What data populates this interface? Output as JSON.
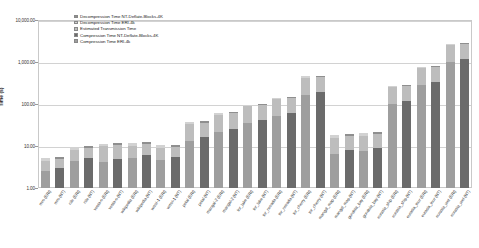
{
  "chart_data": {
    "type": "bar",
    "stacked": true,
    "title": "",
    "xlabel": "",
    "ylabel": "Time (s)",
    "yscale": "log",
    "ylim": [
      1,
      10000
    ],
    "ytick_labels": [
      "10,000.00",
      "1,000.00",
      "100.00",
      "10.00",
      "1.00"
    ],
    "ytick_values": [
      10000,
      1000,
      100,
      10,
      1
    ],
    "grid": true,
    "legend_position": "top-left-inside",
    "series": [
      {
        "name": "Decompression Time NT-Deflate-Blocks-4K",
        "color": "#8f8f8f",
        "values": [
          0,
          0.55,
          0,
          0.95,
          0,
          1.2,
          0,
          1.3,
          0,
          1.1,
          0,
          2.6,
          0,
          4.2,
          0,
          6.0,
          0,
          9.0,
          0,
          22,
          0,
          2.1,
          0,
          2.4,
          0,
          18,
          0,
          48,
          0,
          170
        ]
      },
      {
        "name": "Decompression Time ERI-4k",
        "color": "#d2d2d2",
        "values": [
          0.7,
          0,
          1.3,
          0,
          1.6,
          0,
          1.8,
          0,
          1.5,
          0,
          3.4,
          0,
          5.4,
          0,
          7.8,
          0,
          12,
          0,
          28,
          0,
          2.8,
          0,
          3.1,
          0,
          24,
          0,
          62,
          0,
          220,
          0
        ]
      },
      {
        "name": "Estimated Transmission Time",
        "color": "#bdbdbd",
        "values": [
          2.0,
          2.0,
          3.6,
          3.6,
          5.6,
          5.6,
          5.0,
          5.0,
          4.2,
          4.2,
          20,
          20,
          34,
          34,
          52,
          52,
          78,
          78,
          260,
          260,
          9.0,
          9.0,
          10,
          10,
          150,
          150,
          430,
          430,
          1500,
          1500
        ]
      },
      {
        "name": "Compression Time NT-Deflate-Blocks-4K",
        "color": "#6b6b6b",
        "values": [
          0,
          3.0,
          0,
          5.2,
          0,
          5.0,
          0,
          6.0,
          0,
          5.5,
          0,
          16,
          0,
          26,
          0,
          42,
          0,
          60,
          0,
          190,
          0,
          8.0,
          0,
          9.0,
          0,
          120,
          0,
          330,
          0,
          1200
        ]
      },
      {
        "name": "Compression Time ERI-4k",
        "color": "#9e9e9e",
        "values": [
          2.5,
          0,
          4.4,
          0,
          4.2,
          0,
          5.2,
          0,
          4.6,
          0,
          13,
          0,
          22,
          0,
          36,
          0,
          52,
          0,
          165,
          0,
          6.5,
          0,
          7.5,
          0,
          100,
          0,
          280,
          0,
          1000,
          0
        ]
      }
    ],
    "categories": [
      "mro (ERI)",
      "mro (NT)",
      "nile (ERI)",
      "nile (NT)",
      "vesta-o (ERI)",
      "vesta-o (NT)",
      "wikipedia (ERI)",
      "wikipedia (NT)",
      "wmvi-1 (ERI)",
      "wmvi-1 (NT)",
      "petal (ERI)",
      "petal (NT)",
      "mangal-2 (ERI)",
      "mangal-2 (NT)",
      "tor_lake (ERI)",
      "tor_lake (NT)",
      "tor_nevada (ERI)",
      "tor_nevada (NT)",
      "tor_cherry (ERI)",
      "tor_cherry (NT)",
      "mangal_map (ERI)",
      "mangal_map (NT)",
      "gondola_bay (ERI)",
      "gondola_bay (NT)",
      "eurasia_ship (ERI)",
      "eurasia_ship (NT)",
      "eurasia_tour (ERI)",
      "eurasia_tour (NT)",
      "eurasia_wet (ERI)",
      "eurasia_wet (NT)"
    ]
  }
}
